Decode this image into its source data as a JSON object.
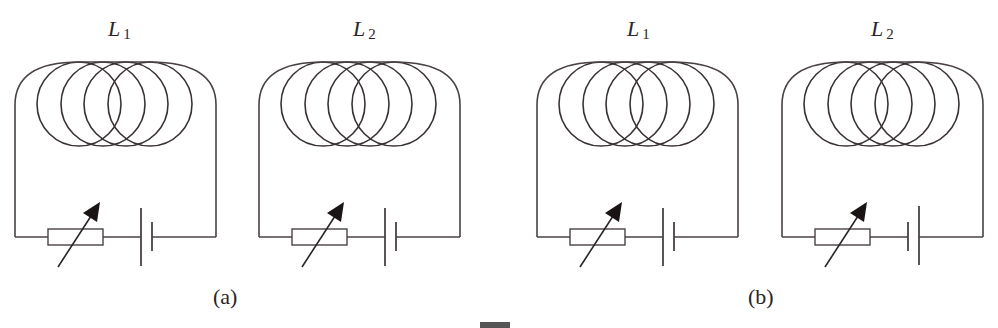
{
  "figure": {
    "panels": [
      {
        "caption": "(a)",
        "circuits": [
          {
            "inductor_label": "L",
            "inductor_subscript": "1",
            "battery_long_plate": "left",
            "components": [
              "coil (4 loops)",
              "rheostat",
              "battery"
            ]
          },
          {
            "inductor_label": "L",
            "inductor_subscript": "2",
            "battery_long_plate": "left",
            "components": [
              "coil (4 loops)",
              "rheostat",
              "battery"
            ]
          }
        ]
      },
      {
        "caption": "(b)",
        "circuits": [
          {
            "inductor_label": "L",
            "inductor_subscript": "1",
            "battery_long_plate": "left",
            "components": [
              "coil (4 loops)",
              "rheostat",
              "battery"
            ]
          },
          {
            "inductor_label": "L",
            "inductor_subscript": "2",
            "battery_long_plate": "right",
            "components": [
              "coil (4 loops)",
              "rheostat",
              "battery"
            ]
          }
        ]
      }
    ],
    "colors": {
      "line": "#4a4242",
      "background": "#ffffff"
    }
  }
}
